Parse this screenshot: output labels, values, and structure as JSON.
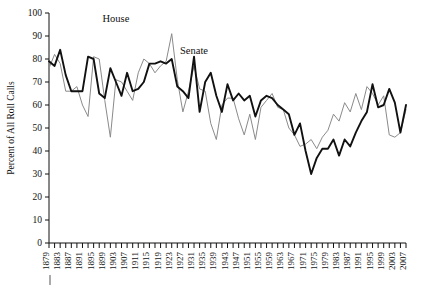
{
  "chart_data": {
    "type": "line",
    "title": "",
    "xlabel": "",
    "ylabel": "Percent of All Roll Calls",
    "ylim": [
      0,
      100
    ],
    "xlim": [
      1879,
      2007
    ],
    "grid": false,
    "legend_position": "inline-annotation",
    "y_ticks": [
      0,
      10,
      20,
      30,
      40,
      50,
      60,
      70,
      80,
      90,
      100
    ],
    "x_tick_step_years": 2,
    "x_tick_label_step_years": 4,
    "x_ticks_labeled": [
      "1879",
      "1883",
      "1887",
      "1891",
      "1895",
      "1899",
      "1903",
      "1907",
      "1911",
      "1915",
      "1919",
      "1923",
      "1927",
      "1931",
      "1935",
      "1939",
      "1943",
      "1947",
      "1951",
      "1955",
      "1959",
      "1963",
      "1967",
      "1971",
      "1975",
      "1979",
      "1983",
      "1987",
      "1991",
      "1995",
      "1999",
      "2003",
      "2007"
    ],
    "x": [
      1879,
      1881,
      1883,
      1885,
      1887,
      1889,
      1891,
      1893,
      1895,
      1897,
      1899,
      1901,
      1903,
      1905,
      1907,
      1909,
      1911,
      1913,
      1915,
      1917,
      1919,
      1921,
      1923,
      1925,
      1927,
      1929,
      1931,
      1933,
      1935,
      1937,
      1939,
      1941,
      1943,
      1945,
      1947,
      1949,
      1951,
      1953,
      1955,
      1957,
      1959,
      1961,
      1963,
      1965,
      1967,
      1969,
      1971,
      1973,
      1975,
      1977,
      1979,
      1981,
      1983,
      1985,
      1987,
      1989,
      1991,
      1993,
      1995,
      1997,
      1999,
      2001,
      2003,
      2005,
      2007
    ],
    "series": [
      {
        "name": "House",
        "color": "#8a8a8a",
        "width": 1.0,
        "values": [
          76,
          82,
          78,
          66,
          66,
          68,
          60,
          55,
          81,
          80,
          62,
          46,
          71,
          70,
          66,
          62,
          74,
          80,
          78,
          74,
          77,
          79,
          91,
          71,
          57,
          66,
          77,
          67,
          66,
          52,
          45,
          60,
          63,
          63,
          54,
          47,
          56,
          45,
          59,
          62,
          65,
          59,
          58,
          50,
          47,
          42,
          43,
          45,
          41,
          46,
          49,
          56,
          53,
          61,
          57,
          65,
          58,
          68,
          65,
          60,
          64,
          47,
          46,
          48,
          58
        ]
      },
      {
        "name": "Senate",
        "color": "#111111",
        "width": 1.9,
        "values": [
          79,
          77,
          84,
          73,
          66,
          66,
          66,
          81,
          80,
          65,
          63,
          76,
          70,
          64,
          74,
          66,
          67,
          70,
          78,
          78,
          79,
          78,
          80,
          68,
          66,
          63,
          81,
          57,
          70,
          74,
          64,
          57,
          69,
          62,
          65,
          62,
          64,
          55,
          62,
          64,
          63,
          60,
          58,
          56,
          47,
          52,
          40,
          30,
          37,
          41,
          41,
          45,
          38,
          45,
          42,
          48,
          53,
          57,
          69,
          59,
          60,
          67,
          61,
          48,
          60
        ]
      }
    ],
    "annotations": [
      {
        "text": "House",
        "near_x": 1903,
        "near_y": 96
      },
      {
        "text": "Senate",
        "near_x": 1931,
        "near_y": 82
      }
    ]
  }
}
